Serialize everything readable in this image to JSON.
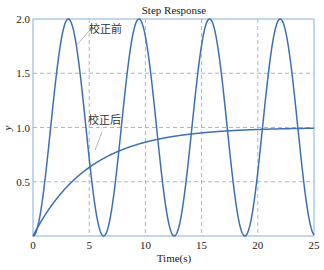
{
  "chart_data": {
    "type": "line",
    "title": "Step Response",
    "xlabel": "Time(s)",
    "ylabel": "y",
    "xlim": [
      0,
      25
    ],
    "ylim": [
      0,
      2.0
    ],
    "x_ticks": [
      "0",
      "5",
      "10",
      "15",
      "20",
      "25"
    ],
    "y_ticks": [
      "0.5",
      "1.0",
      "1.5",
      "2.0"
    ],
    "grid": true,
    "series": [
      {
        "name": "校正前",
        "description": "undamped oscillation y = 1 - cos(t)",
        "x": [
          0,
          1.57,
          3.14,
          4.71,
          6.28,
          7.85,
          9.42,
          11.0,
          12.57,
          14.14,
          15.71,
          17.28,
          18.85,
          20.42,
          21.99,
          23.56,
          25
        ],
        "values": [
          0,
          1.0,
          2.0,
          1.0,
          0,
          1.0,
          2.0,
          1.0,
          0,
          1.0,
          2.0,
          1.0,
          0,
          1.0,
          2.0,
          1.0,
          0.01
        ]
      },
      {
        "name": "校正后",
        "description": "first-order response y = 1 - exp(-t/5)",
        "x": [
          0,
          2.5,
          5,
          7.5,
          10,
          12.5,
          15,
          17.5,
          20,
          22.5,
          25
        ],
        "values": [
          0,
          0.39,
          0.63,
          0.78,
          0.86,
          0.92,
          0.95,
          0.97,
          0.98,
          0.99,
          0.99
        ]
      }
    ],
    "annotations": [
      {
        "text": "校正前",
        "x": 10.1,
        "y": 1.85
      },
      {
        "text": "校正后",
        "x": 10.1,
        "y": 1.08
      }
    ],
    "colors": {
      "line": "#3c6fb4",
      "grid": "#8fb1d9",
      "axes": "#9cbde0"
    }
  }
}
